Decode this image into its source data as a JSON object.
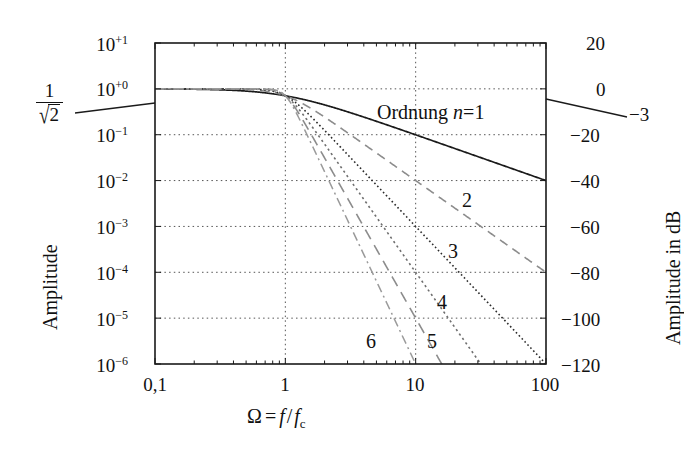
{
  "chart_data": {
    "type": "line",
    "title": "",
    "xlabel": "Ω = f / f_c",
    "ylabel": "Amplitude",
    "y2label": "Amplitude in dB",
    "xscale": "log",
    "yscale": "log",
    "xlim": [
      0.1,
      100
    ],
    "ylim": [
      1e-06,
      10
    ],
    "grid": true,
    "x_ticks": [
      "0,1",
      "1",
      "10",
      "100"
    ],
    "x_tick_values": [
      0.1,
      1,
      10,
      100
    ],
    "y_ticks": [
      "10+1",
      "10+0",
      "10-1",
      "10-2",
      "10-3",
      "10-4",
      "10-5",
      "10-6"
    ],
    "y_tick_mantissa": "10",
    "y_tick_exponents": [
      "+1",
      "+0",
      "−1",
      "−2",
      "−3",
      "−4",
      "−5",
      "−6"
    ],
    "y_tick_values": [
      10,
      1,
      0.1,
      0.01,
      0.001,
      0.0001,
      1e-05,
      1e-06
    ],
    "y2_ticks": [
      "20",
      "0",
      "−20",
      "−40",
      "−60",
      "−80",
      "−100",
      "−120"
    ],
    "y2_tick_values": [
      20,
      0,
      -20,
      -40,
      -60,
      -80,
      -100,
      -120
    ],
    "annotations": [
      {
        "text": "Ordnung n = 1",
        "x": 430,
        "y": 113
      },
      {
        "text": "−3",
        "x": 632,
        "y": 110
      },
      {
        "text": "1/√2",
        "x": 40,
        "y": 80
      }
    ],
    "series": [
      {
        "name": "1",
        "order": 1,
        "label": "Ordnung n = 1",
        "style": "solid",
        "color": "#1a1a1a",
        "label_x": 430,
        "label_y": 113,
        "stopband_db_at_100": -40
      },
      {
        "name": "2",
        "order": 2,
        "label": "2",
        "style": "dashed",
        "color": "#8c8c8c",
        "label_x": 466,
        "label_y": 200,
        "stopband_db_at_100": -80
      },
      {
        "name": "3",
        "order": 3,
        "label": "3",
        "style": "dotted-fine",
        "color": "#2b2b2b",
        "label_x": 452,
        "label_y": 251,
        "stopband_db_at_100": -120
      },
      {
        "name": "4",
        "order": 4,
        "label": "4",
        "style": "dotted",
        "color": "#6e6e6e",
        "label_x": 441,
        "label_y": 302,
        "stopband_db_at_100": -160
      },
      {
        "name": "5",
        "order": 5,
        "label": "5",
        "style": "dashed-long",
        "color": "#8c8c8c",
        "label_x": 431,
        "label_y": 341,
        "stopband_db_at_100": -200
      },
      {
        "name": "6",
        "order": 6,
        "label": "6",
        "style": "dash-dot",
        "color": "#9a9a9a",
        "label_x": 370,
        "label_y": 341,
        "stopband_db_at_100": -240
      }
    ]
  },
  "labels": {
    "x_axis_title_omega": "Ω",
    "x_axis_title_eq": "=",
    "x_axis_title_f": "f",
    "x_axis_title_slash": "/",
    "x_axis_title_fc_f": "f",
    "x_axis_title_fc_sub": "c",
    "y_axis_title": "Amplitude",
    "y2_axis_title": "Amplitude in dB",
    "cutoff_num": "1",
    "cutoff_den_radicand": "2",
    "minus3db": "−3",
    "ordnung_word": "Ordnung",
    "ordnung_n": "n",
    "ordnung_eq": "=",
    "ordnung_value": "1"
  },
  "colors": {
    "background": "#ffffff",
    "axis": "#1a1a1a",
    "grid": "#555555",
    "curve_n1": "#1a1a1a",
    "curve_n2": "#8c8c8c",
    "curve_n3": "#2b2b2b",
    "curve_n4": "#6e6e6e",
    "curve_n5": "#8c8c8c",
    "curve_n6": "#9a9a9a"
  }
}
